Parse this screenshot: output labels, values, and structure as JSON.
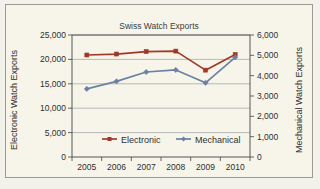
{
  "panel": {
    "background_color": "#f7f5e9",
    "border_color": "#9a9a92"
  },
  "chart_data": {
    "type": "line",
    "title": "Swiss Watch Exports",
    "xlabel": "",
    "ylabel": "Electronic Watch Exports",
    "y2label": "Mechanical Watch Exports",
    "categories": [
      "2005",
      "2006",
      "2007",
      "2008",
      "2009",
      "2010"
    ],
    "x_tick_labels": [
      "2005",
      "2006",
      "2007",
      "2008",
      "2009",
      "2010"
    ],
    "ylim": [
      0,
      25000
    ],
    "y2lim": [
      0,
      6000
    ],
    "y_tick_labels": [
      "0",
      "5,000",
      "10,000",
      "15,000",
      "20,000",
      "25,000"
    ],
    "y_tick_values": [
      0,
      5000,
      10000,
      15000,
      20000,
      25000
    ],
    "y2_tick_labels": [
      "0",
      "1,000",
      "2,000",
      "3,000",
      "4,000",
      "5,000",
      "6,000"
    ],
    "y2_tick_values": [
      0,
      1000,
      2000,
      3000,
      4000,
      5000,
      6000
    ],
    "grid": true,
    "grid_color": "#9aa0a6",
    "legend_position": "inside-bottom-center",
    "series": [
      {
        "name": "Electronic",
        "axis": "left",
        "color": "#a0382a",
        "marker": "square",
        "values": [
          20900,
          21100,
          21600,
          21700,
          17800,
          21000
        ]
      },
      {
        "name": "Mechanical",
        "axis": "right",
        "color": "#6c80a6",
        "marker": "diamond",
        "values": [
          3350,
          3720,
          4180,
          4280,
          3650,
          4900
        ]
      }
    ]
  },
  "legend": {
    "items": [
      {
        "label": "Electronic",
        "color": "#a0382a"
      },
      {
        "label": "Mechanical",
        "color": "#6c80a6"
      }
    ]
  }
}
